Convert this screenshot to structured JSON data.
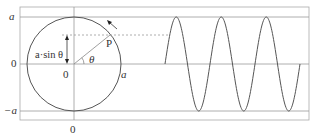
{
  "diagram": {
    "labels": {
      "y_top": "a",
      "y_mid": "0",
      "y_bottom": "−a",
      "x_origin": "0",
      "center": "0",
      "radius": "a",
      "point": "P",
      "angle": "θ",
      "projection": "a·sin θ"
    },
    "colors": {
      "line": "#555555",
      "grid": "#9a9a9a",
      "text": "#333333",
      "background": "#ffffff"
    },
    "sine": {
      "amplitude_label": "a",
      "periods_shown": 3
    }
  }
}
